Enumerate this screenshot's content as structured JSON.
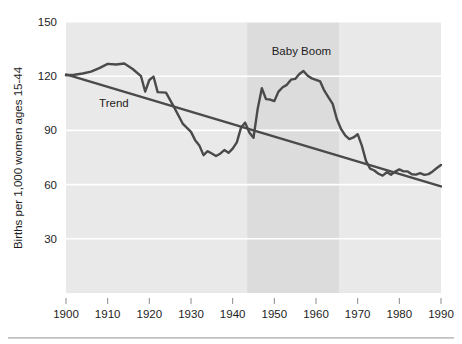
{
  "figure": {
    "name": "us-fertility-rate-1900-1990",
    "background_color": "#ffffff",
    "plot_background_color": "#e9e9e9",
    "highlight_band_color": "#dcdcdc",
    "gridline_color": "#ffffff",
    "series_color": "#4a4a4a",
    "trend_color": "#4a4a4a"
  },
  "chart_data": {
    "type": "line",
    "title": "",
    "xlabel": "",
    "ylabel": "Births per 1,000 women ages 15-44",
    "xlim": [
      1900,
      1990
    ],
    "ylim": [
      0,
      150
    ],
    "grid": true,
    "gridlines_y": [
      30,
      60,
      90,
      120,
      150
    ],
    "legend_position": "none",
    "yticks": [
      30,
      60,
      90,
      120,
      150
    ],
    "ytick_labels": [
      "30",
      "60",
      "90",
      "120",
      "150"
    ],
    "xticks": [
      1900,
      1910,
      1920,
      1930,
      1940,
      1950,
      1960,
      1970,
      1980,
      1990
    ],
    "xtick_labels": [
      "1900",
      "1910",
      "1920",
      "1930",
      "1940",
      "1950",
      "1960",
      "1970",
      "1980",
      "1990"
    ],
    "annotations": [
      {
        "text": "Trend",
        "x": 1911.5,
        "y": 103
      },
      {
        "text": "Baby Boom",
        "x": 1956.5,
        "y": 132
      }
    ],
    "shaded_regions": [
      {
        "label": "Baby Boom",
        "x_start": 1943.5,
        "x_end": 1965.5
      }
    ],
    "series": [
      {
        "name": "Birth rate",
        "x": [
          1900,
          1902,
          1904,
          1906,
          1908,
          1910,
          1912,
          1914,
          1916,
          1918,
          1919,
          1920,
          1921,
          1922,
          1924,
          1926,
          1928,
          1930,
          1931,
          1932,
          1933,
          1934,
          1935,
          1936,
          1937,
          1938,
          1939,
          1940,
          1941,
          1942,
          1943,
          1944,
          1945,
          1946,
          1947,
          1948,
          1949,
          1950,
          1951,
          1952,
          1953,
          1954,
          1955,
          1956,
          1957,
          1958,
          1959,
          1960,
          1961,
          1962,
          1963,
          1964,
          1965,
          1966,
          1967,
          1968,
          1969,
          1970,
          1971,
          1972,
          1973,
          1974,
          1975,
          1976,
          1977,
          1978,
          1979,
          1980,
          1981,
          1982,
          1983,
          1984,
          1985,
          1986,
          1987,
          1988,
          1989,
          1990
        ],
        "values": [
          120.5,
          120.8,
          121.5,
          122.5,
          124.5,
          126.8,
          126.5,
          127.0,
          124.0,
          120.0,
          111.5,
          117.9,
          119.8,
          111.2,
          110.9,
          102.6,
          93.8,
          89.2,
          84.6,
          81.7,
          76.3,
          78.5,
          77.2,
          75.8,
          77.1,
          79.1,
          77.6,
          79.9,
          83.4,
          91.5,
          94.3,
          88.8,
          85.9,
          101.9,
          113.3,
          107.3,
          107.1,
          106.2,
          111.5,
          113.9,
          115.2,
          118.1,
          118.5,
          121.2,
          122.9,
          120.2,
          118.8,
          118.0,
          117.1,
          112.0,
          108.3,
          104.7,
          96.3,
          90.8,
          87.2,
          85.2,
          86.1,
          87.9,
          81.6,
          73.1,
          68.8,
          67.8,
          66.0,
          65.0,
          66.8,
          65.5,
          67.2,
          68.4,
          67.3,
          67.3,
          65.7,
          65.5,
          66.3,
          65.4,
          65.8,
          67.3,
          69.2,
          70.9
        ]
      },
      {
        "name": "Trend",
        "x": [
          1900,
          1990
        ],
        "values": [
          121.0,
          59.0
        ]
      }
    ]
  },
  "axis": {
    "y_title": "Births per 1,000 women ages 15-44"
  }
}
